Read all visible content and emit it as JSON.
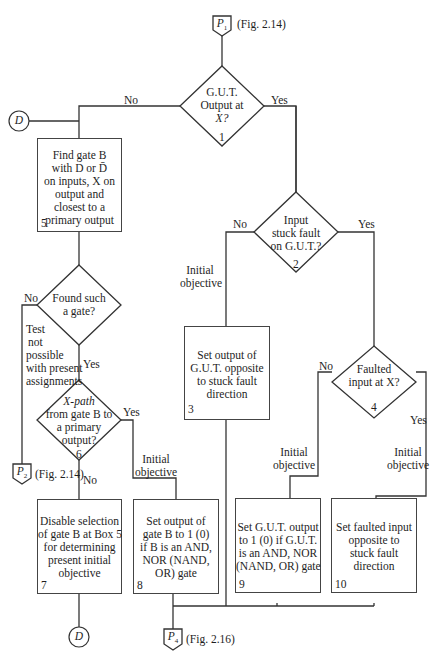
{
  "connectors": {
    "p1": {
      "label": "P",
      "sub": "1",
      "ref": "(Fig. 2.14)"
    },
    "p2": {
      "label": "P",
      "sub": "2",
      "ref": "(Fig. 2.14)"
    },
    "p4": {
      "label": "P",
      "sub": "4",
      "ref": "(Fig. 2.16)"
    },
    "d_top": {
      "label": "D"
    },
    "d_bottom": {
      "label": "D"
    }
  },
  "decisions": {
    "d1": {
      "lines": [
        "G.U.T.",
        "Output at",
        "X?"
      ],
      "number": "1",
      "no": "No",
      "yes": "Yes"
    },
    "d2": {
      "lines": [
        "Input",
        "stuck fault",
        "on G.U.T.?"
      ],
      "number": "2",
      "no": "No",
      "yes": "Yes"
    },
    "d4": {
      "lines": [
        "Faulted",
        "input at X?"
      ],
      "number": "4",
      "no": "No",
      "yes": "Yes"
    },
    "found": {
      "lines": [
        "Found such",
        "a gate?"
      ],
      "no": "No",
      "yes": "Yes"
    },
    "d6": {
      "lines": [
        "X-path",
        "from gate B to",
        "a primary",
        "output?"
      ],
      "number": "6",
      "no": "No",
      "yes": "Yes"
    }
  },
  "boxes": {
    "b3": {
      "lines": [
        "Set output of",
        "G.U.T. opposite",
        "to stuck fault",
        "direction"
      ],
      "number": "3"
    },
    "b5": {
      "lines": [
        "Find gate B",
        "with D or D̄",
        "on inputs, X on",
        "output and",
        "closest to a",
        "primary output"
      ],
      "number": "5"
    },
    "b7": {
      "lines": [
        "Disable selection",
        "of gate B at Box 5",
        "for determining",
        "present initial",
        "objective"
      ],
      "number": "7"
    },
    "b8": {
      "lines": [
        "Set output of",
        "gate B to  1 (0)",
        "if B is an AND,",
        "NOR (NAND,",
        "OR) gate"
      ],
      "number": "8"
    },
    "b9": {
      "lines": [
        "Set G.U.T. output",
        "to 1 (0) if G.U.T.",
        "is an AND, NOR",
        "(NAND, OR) gate"
      ],
      "number": "9"
    },
    "b10": {
      "lines": [
        "Set faulted input",
        "opposite to",
        "stuck fault",
        "direction"
      ],
      "number": "10"
    }
  },
  "annotations": {
    "initial_objective": [
      "Initial",
      "objective"
    ],
    "test_not_possible": [
      "Test",
      "not",
      "possible",
      "with present",
      "assignments"
    ]
  }
}
